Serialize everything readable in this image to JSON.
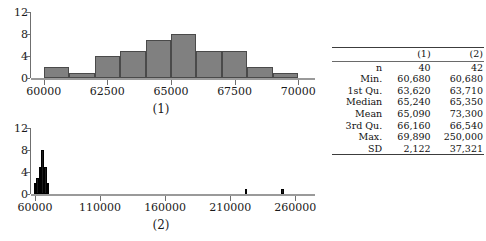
{
  "figure": {
    "panels": [
      {
        "caption": "(1)",
        "y_ticks": [
          "0",
          "4",
          "8",
          "12"
        ],
        "x_ticks": [
          "60000",
          "62500",
          "65000",
          "67500",
          "70000"
        ]
      },
      {
        "caption": "(2)",
        "y_ticks": [
          "0",
          "4",
          "8",
          "12"
        ],
        "x_ticks": [
          "60000",
          "110000",
          "160000",
          "210000",
          "260000"
        ]
      }
    ]
  },
  "chart_data": [
    {
      "type": "bar",
      "title": "(1)",
      "xlabel": "",
      "ylabel": "",
      "xlim": [
        59500,
        70500
      ],
      "ylim": [
        0,
        12
      ],
      "xtick_values": [
        60000,
        62500,
        65000,
        67500,
        70000
      ],
      "ytick_values": [
        0,
        4,
        8,
        12
      ],
      "bin_width": 1000,
      "bin_starts": [
        60000,
        61000,
        62000,
        63000,
        64000,
        65000,
        66000,
        67000,
        68000,
        69000
      ],
      "categories": [
        "60000-61000",
        "61000-62000",
        "62000-63000",
        "63000-64000",
        "64000-65000",
        "65000-66000",
        "66000-67000",
        "67000-68000",
        "68000-69000",
        "69000-70000"
      ],
      "values": [
        2,
        1,
        4,
        5,
        7,
        8,
        5,
        5,
        2,
        1
      ],
      "grid": false,
      "legend": "none",
      "bar_color": "#808080",
      "bar_border_color": "#4a4a4a"
    },
    {
      "type": "bar",
      "title": "(2)",
      "xlabel": "",
      "ylabel": "",
      "xlim": [
        57000,
        272000
      ],
      "ylim": [
        0,
        12
      ],
      "xtick_values": [
        60000,
        110000,
        160000,
        210000,
        260000
      ],
      "ytick_values": [
        0,
        4,
        8,
        12
      ],
      "bin_width": 2000,
      "bin_starts": [
        59000,
        61000,
        63000,
        65000,
        67000,
        69000,
        221000,
        249000
      ],
      "categories": [
        "59000-61000",
        "61000-63000",
        "63000-65000",
        "65000-67000",
        "67000-69000",
        "69000-71000",
        "221000-223000",
        "249000-251000"
      ],
      "values": [
        2,
        3,
        5,
        8,
        5,
        2,
        1,
        1
      ],
      "grid": false,
      "legend": "none",
      "bar_color": "#1c1c1c",
      "bar_border_color": "#000000"
    }
  ],
  "table": {
    "columns": [
      "",
      "(1)",
      "(2)"
    ],
    "rows": [
      {
        "label": "n",
        "c1": "40",
        "c2": "42"
      },
      {
        "label": "Min.",
        "c1": "60,680",
        "c2": "60,680"
      },
      {
        "label": "1st Qu.",
        "c1": "63,620",
        "c2": "63,710"
      },
      {
        "label": "Median",
        "c1": "65,240",
        "c2": "65,350"
      },
      {
        "label": "Mean",
        "c1": "65,090",
        "c2": "73,300"
      },
      {
        "label": "3rd Qu.",
        "c1": "66,160",
        "c2": "66,540"
      },
      {
        "label": "Max.",
        "c1": "69,890",
        "c2": "250,000"
      },
      {
        "label": "SD",
        "c1": "2,122",
        "c2": "37,321"
      }
    ]
  }
}
